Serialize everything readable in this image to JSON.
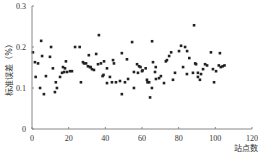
{
  "chart_data": {
    "type": "scatter",
    "title": "",
    "xlabel": "站点数",
    "ylabel": "标准误差（%）",
    "xlim": [
      0,
      120
    ],
    "ylim": [
      0,
      0.3
    ],
    "x_ticks": [
      0,
      20,
      40,
      60,
      80,
      100,
      120
    ],
    "y_ticks": [
      0,
      0.1,
      0.2,
      0.3
    ],
    "x_tick_labels": [
      "0",
      "20",
      "40",
      "60",
      "80",
      "100",
      "120"
    ],
    "y_tick_labels": [
      "0",
      "0.1",
      "0.2",
      "0.3"
    ],
    "grid": false,
    "legend": null,
    "marker_color": "#222222",
    "series": [
      {
        "name": "标准误差",
        "points": [
          [
            0.5,
            0.187
          ],
          [
            1.6,
            0.163
          ],
          [
            3.3,
            0.16
          ],
          [
            5.5,
            0.178
          ],
          [
            5,
            0.215
          ],
          [
            2,
            0.127
          ],
          [
            4.4,
            0.1
          ],
          [
            7.6,
            0.129
          ],
          [
            6.5,
            0.085
          ],
          [
            9.8,
            0.176
          ],
          [
            10.4,
            0.2
          ],
          [
            11.4,
            0.148
          ],
          [
            12.5,
            0.09
          ],
          [
            13.6,
            0.1
          ],
          [
            13,
            0.114
          ],
          [
            15.3,
            0.127
          ],
          [
            16.4,
            0.137
          ],
          [
            17.5,
            0.139
          ],
          [
            18,
            0.148
          ],
          [
            18.5,
            0.165
          ],
          [
            16.9,
            0.151
          ],
          [
            19.1,
            0.139
          ],
          [
            20.7,
            0.141
          ],
          [
            21.8,
            0.141
          ],
          [
            23.5,
            0.2
          ],
          [
            26,
            0.2
          ],
          [
            27.8,
            0.163
          ],
          [
            28.4,
            0.16
          ],
          [
            26.7,
            0.114
          ],
          [
            30.5,
            0.153
          ],
          [
            31.6,
            0.151
          ],
          [
            36.5,
            0.229
          ],
          [
            31,
            0.18
          ],
          [
            35,
            0.183
          ],
          [
            29.5,
            0.16
          ],
          [
            32,
            0.151
          ],
          [
            32.7,
            0.146
          ],
          [
            33.8,
            0.144
          ],
          [
            36,
            0.158
          ],
          [
            37.6,
            0.16
          ],
          [
            39.3,
            0.165
          ],
          [
            38.5,
            0.129
          ],
          [
            39,
            0.132
          ],
          [
            40.9,
            0.148
          ],
          [
            42.5,
            0.127
          ],
          [
            44.2,
            0.168
          ],
          [
            44.7,
            0.16
          ],
          [
            40.9,
            0.112
          ],
          [
            43.6,
            0.114
          ],
          [
            45.8,
            0.114
          ],
          [
            48,
            0.117
          ],
          [
            50.7,
            0.114
          ],
          [
            51.8,
            0.17
          ],
          [
            52.4,
            0.122
          ],
          [
            49,
            0.185
          ],
          [
            54.6,
            0.212
          ],
          [
            55.6,
            0.139
          ],
          [
            57.3,
            0.158
          ],
          [
            58.4,
            0.153
          ],
          [
            57.8,
            0.137
          ],
          [
            60,
            0.141
          ],
          [
            62,
            0.148
          ],
          [
            55.6,
            0.1
          ],
          [
            49,
            0.085
          ],
          [
            63,
            0.114
          ],
          [
            88.4,
            0.253
          ],
          [
            65.5,
            0.214
          ],
          [
            81.3,
            0.203
          ],
          [
            83.5,
            0.2
          ],
          [
            80.2,
            0.19
          ],
          [
            84.6,
            0.19
          ],
          [
            75.9,
            0.187
          ],
          [
            74.8,
            0.178
          ],
          [
            73.6,
            0.168
          ],
          [
            66,
            0.163
          ],
          [
            59.2,
            0.151
          ],
          [
            60.3,
            0.143
          ],
          [
            73,
            0.165
          ],
          [
            85.8,
            0.173
          ],
          [
            89,
            0.16
          ],
          [
            82.4,
            0.151
          ],
          [
            78,
            0.137
          ],
          [
            67.1,
            0.139
          ],
          [
            67.6,
            0.122
          ],
          [
            63.9,
            0.114
          ],
          [
            69.3,
            0.124
          ],
          [
            70.3,
            0.129
          ],
          [
            72,
            0.112
          ],
          [
            76.9,
            0.12
          ],
          [
            84.5,
            0.134
          ],
          [
            65.4,
            0.1
          ],
          [
            67.5,
            0.151
          ],
          [
            64.4,
            0.077
          ],
          [
            62.7,
            0.12
          ],
          [
            97.6,
            0.187
          ],
          [
            102.5,
            0.185
          ],
          [
            89.5,
            0.158
          ],
          [
            94.4,
            0.158
          ],
          [
            95.5,
            0.155
          ],
          [
            101.9,
            0.155
          ],
          [
            105,
            0.155
          ],
          [
            103,
            0.151
          ],
          [
            104,
            0.153
          ],
          [
            90.5,
            0.137
          ],
          [
            93.3,
            0.146
          ],
          [
            98.7,
            0.146
          ],
          [
            100.4,
            0.141
          ],
          [
            92.2,
            0.134
          ],
          [
            87.8,
            0.137
          ],
          [
            90.5,
            0.127
          ],
          [
            91.6,
            0.12
          ],
          [
            99.3,
            0.114
          ]
        ]
      }
    ]
  }
}
